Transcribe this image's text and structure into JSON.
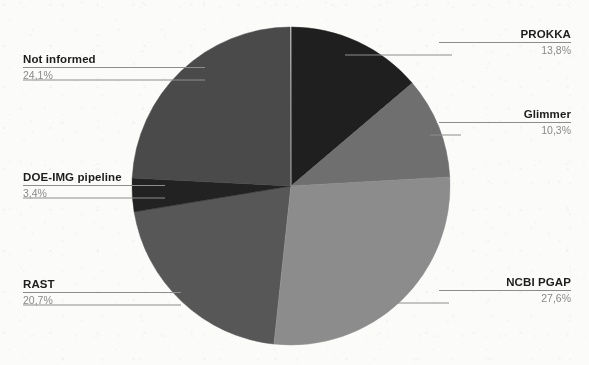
{
  "chart_data": {
    "type": "pie",
    "title": "",
    "subtitle": "",
    "xlabel": "",
    "ylabel": "",
    "legend_position": "callout-labels",
    "grid": false,
    "value_suffix": "%",
    "decimal_separator": ",",
    "total": 100.0,
    "start_angle_deg": 0,
    "direction": "clockwise",
    "categories": [
      "PROKKA",
      "Glimmer",
      "NCBI PGAP",
      "RAST",
      "DOE-IMG pipeline",
      "Not informed"
    ],
    "values": [
      13.8,
      10.3,
      27.6,
      20.7,
      3.4,
      24.1
    ],
    "labels_display": [
      "13,8%",
      "10,3%",
      "27,6%",
      "20,7%",
      "3,4%",
      "24,1%"
    ],
    "colors": [
      "#1f1f1f",
      "#6f6f6f",
      "#8c8c8c",
      "#575757",
      "#222222",
      "#4a4a4a"
    ],
    "slices": [
      {
        "name": "PROKKA",
        "value": 13.8,
        "value_display": "13,8%",
        "color": "#1f1f1f",
        "start_deg": 0.0,
        "end_deg": 49.68
      },
      {
        "name": "Glimmer",
        "value": 10.3,
        "value_display": "10,3%",
        "color": "#6f6f6f",
        "start_deg": 49.68,
        "end_deg": 86.76
      },
      {
        "name": "NCBI PGAP",
        "value": 27.6,
        "value_display": "27,6%",
        "color": "#8c8c8c",
        "start_deg": 86.76,
        "end_deg": 186.12
      },
      {
        "name": "RAST",
        "value": 20.7,
        "value_display": "20,7%",
        "color": "#575757",
        "start_deg": 186.12,
        "end_deg": 260.64
      },
      {
        "name": "DOE-IMG pipeline",
        "value": 3.4,
        "value_display": "3,4%",
        "color": "#222222",
        "start_deg": 260.64,
        "end_deg": 272.88
      },
      {
        "name": "Not informed",
        "value": 24.1,
        "value_display": "24,1%",
        "color": "#4a4a4a",
        "start_deg": 272.88,
        "end_deg": 359.64
      }
    ]
  },
  "geometry": {
    "center_x": 291,
    "center_y": 186,
    "radius": 159
  },
  "callouts": {
    "prokka": {
      "name": "PROKKA",
      "percent": "13,8%"
    },
    "glimmer": {
      "name": "Glimmer",
      "percent": "10,3%"
    },
    "ncbi_pgap": {
      "name": "NCBI PGAP",
      "percent": "27,6%"
    },
    "rast": {
      "name": "RAST",
      "percent": "20,7%"
    },
    "doe_img": {
      "name": "DOE-IMG pipeline",
      "percent": "3,4%"
    },
    "not_informed": {
      "name": "Not informed",
      "percent": "24,1%"
    }
  },
  "theme": {
    "background": "#fbfbfa",
    "label_text": "#1d1d1b",
    "percent_text": "#8a8a8a",
    "leader_line": "#8d8d8d"
  }
}
